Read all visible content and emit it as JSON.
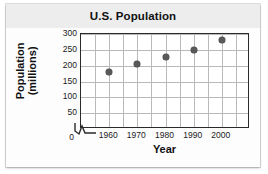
{
  "figure": {
    "title": "U.S. Population",
    "background_color": "#fdfdfd",
    "title_band_color": "#ededed"
  },
  "chart_data": {
    "type": "scatter",
    "title": "U.S. Population",
    "xlabel": "Year",
    "ylabel_line1": "Population",
    "ylabel_line2": "(millions)",
    "x": [
      1960,
      1970,
      1980,
      1990,
      2000
    ],
    "values": [
      180,
      205,
      228,
      250,
      282
    ],
    "categories": [
      "1960",
      "1970",
      "1980",
      "1990",
      "2000"
    ],
    "xlim": [
      1950,
      2010
    ],
    "ylim": [
      0,
      300
    ],
    "xticks": [
      1960,
      1970,
      1980,
      1990,
      2000
    ],
    "xtick_labels": [
      "1960",
      "1970",
      "1980",
      "1990",
      "2000"
    ],
    "yticks": [
      0,
      50,
      100,
      150,
      200,
      250,
      300
    ],
    "ytick_labels": [
      "0",
      "50",
      "100",
      "150",
      "200",
      "250",
      "300"
    ],
    "x_origin_label": "0",
    "grid": true,
    "grid_color": "#b9b9b9",
    "axis_break": "x-axis zigzag near origin",
    "marker_color": "#595959",
    "legend": null
  }
}
